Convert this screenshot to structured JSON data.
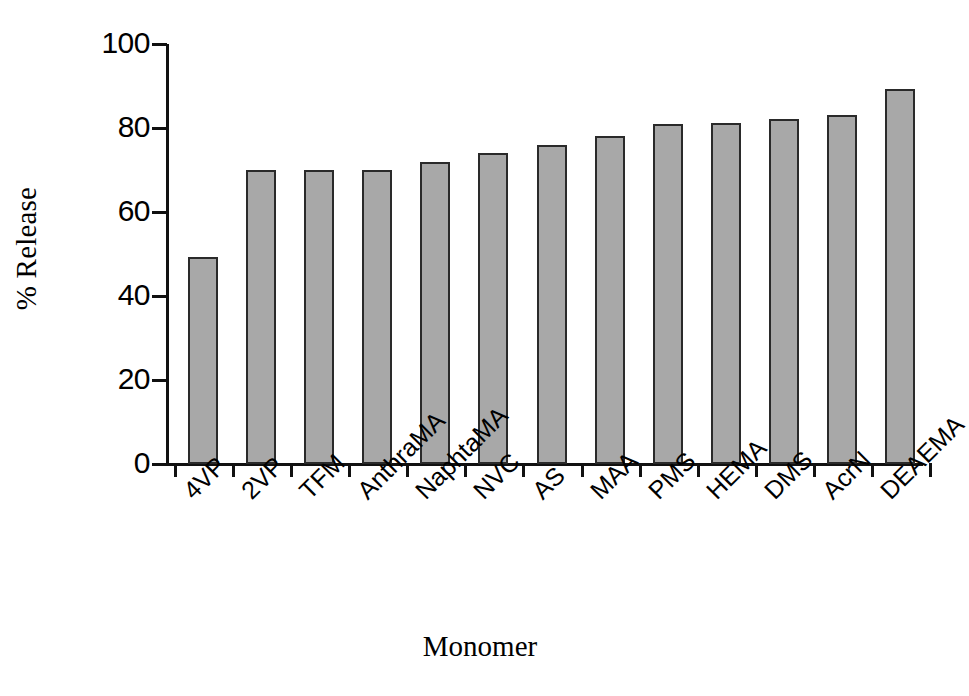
{
  "chart_data": {
    "type": "bar",
    "title": "",
    "subtitle": "",
    "xlabel": "Monomer",
    "ylabel": "% Release",
    "categories": [
      "4VP",
      "2VP",
      "TFM",
      "AnthraMA",
      "NaphtaMA",
      "NVC",
      "AS",
      "MAA",
      "PMS",
      "HEMA",
      "DMS",
      "AcrN",
      "DEAEMA"
    ],
    "values": [
      49.3,
      70.0,
      70.0,
      70.0,
      72.0,
      74.0,
      76.0,
      78.0,
      81.0,
      81.3,
      82.2,
      83.2,
      89.3
    ],
    "ylim": [
      0,
      100
    ],
    "yticks": [
      0,
      20,
      40,
      60,
      80,
      100
    ],
    "ytick_labels": [
      "0",
      "20",
      "40",
      "60",
      "80",
      "100"
    ],
    "grid": false,
    "legend": "none",
    "bar_fill_color": "#a8a8a8",
    "bar_edge_color": "#2a2a2a",
    "axis_color": "#111111",
    "background_color": "#ffffff"
  }
}
